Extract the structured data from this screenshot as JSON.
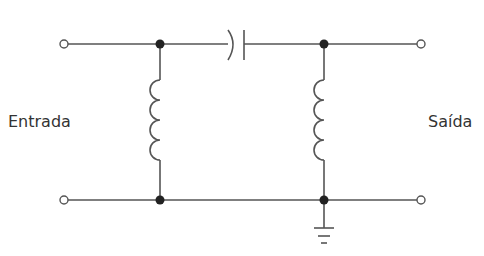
{
  "diagram": {
    "type": "circuit-schematic",
    "labels": {
      "input": "Entrada",
      "output": "Saída"
    },
    "components": [
      {
        "id": "L1",
        "kind": "inductor",
        "orientation": "vertical",
        "position": "left shunt"
      },
      {
        "id": "C1",
        "kind": "capacitor",
        "orientation": "horizontal",
        "position": "series top"
      },
      {
        "id": "L2",
        "kind": "inductor",
        "orientation": "vertical",
        "position": "right shunt"
      },
      {
        "id": "GND",
        "kind": "ground",
        "position": "bottom right node"
      }
    ],
    "terminals": [
      "input-top",
      "input-bottom",
      "output-top",
      "output-bottom"
    ],
    "colors": {
      "wire": "#555555",
      "node": "#222222",
      "text": "#333333"
    }
  }
}
